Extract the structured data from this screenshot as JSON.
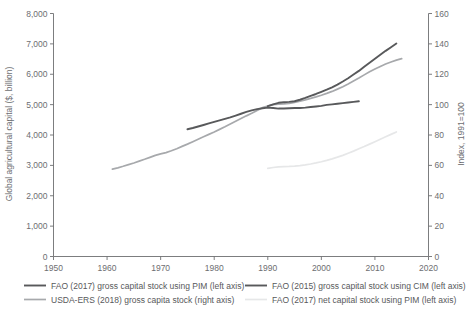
{
  "chart_data": {
    "type": "line",
    "title": "",
    "subtitle": "",
    "xlabel": "",
    "ylabel": "Global agricultural capital ($, billion)",
    "y2label": "Index, 1991=100",
    "xlim": [
      1950,
      2020
    ],
    "ylim": [
      0,
      8000
    ],
    "y2lim": [
      0,
      160
    ],
    "grid": false,
    "legend_position": "bottom",
    "x_ticks": [
      "1950",
      "1960",
      "1970",
      "1980",
      "1990",
      "2000",
      "2010",
      "2020"
    ],
    "x_tick_values": [
      1950,
      1960,
      1970,
      1980,
      1990,
      2000,
      2010,
      2020
    ],
    "y_ticks": [
      "0",
      "1,000",
      "2,000",
      "3,000",
      "4,000",
      "5,000",
      "6,000",
      "7,000",
      "8,000"
    ],
    "y_tick_values": [
      0,
      1000,
      2000,
      3000,
      4000,
      5000,
      6000,
      7000,
      8000
    ],
    "y2_ticks": [
      "0",
      "20",
      "40",
      "60",
      "80",
      "100",
      "120",
      "140",
      "160"
    ],
    "y2_tick_values": [
      0,
      20,
      40,
      60,
      80,
      100,
      120,
      140,
      160
    ],
    "series": [
      {
        "name": "FAO (2017) gross capital stock using PIM (left axis)",
        "axis": "left",
        "color": "#58595b",
        "width": 1.9,
        "x": [
          1990,
          1991,
          1992,
          1993,
          1994,
          1995,
          1996,
          1997,
          1998,
          1999,
          2000,
          2001,
          2002,
          2003,
          2004,
          2005,
          2006,
          2007,
          2008,
          2009,
          2010,
          2011,
          2012,
          2013,
          2014
        ],
        "values": [
          4950,
          5010,
          5060,
          5080,
          5090,
          5110,
          5160,
          5220,
          5290,
          5350,
          5420,
          5490,
          5570,
          5660,
          5760,
          5870,
          5990,
          6110,
          6250,
          6380,
          6510,
          6640,
          6770,
          6890,
          7010
        ]
      },
      {
        "name": "FAO (2015) gross capital stock using CIM (left axis)",
        "axis": "left",
        "color": "#58595b",
        "width": 1.9,
        "x": [
          1975,
          1976,
          1977,
          1978,
          1979,
          1980,
          1981,
          1982,
          1983,
          1984,
          1985,
          1986,
          1987,
          1988,
          1989,
          1990,
          1991,
          1992,
          1993,
          1994,
          1995,
          1996,
          1997,
          1998,
          1999,
          2000,
          2001,
          2002,
          2003,
          2004,
          2005,
          2006,
          2007
        ],
        "values": [
          4190,
          4230,
          4280,
          4330,
          4380,
          4430,
          4480,
          4530,
          4580,
          4640,
          4700,
          4760,
          4810,
          4850,
          4880,
          4900,
          4890,
          4870,
          4870,
          4880,
          4890,
          4890,
          4900,
          4920,
          4940,
          4960,
          4990,
          5010,
          5030,
          5050,
          5070,
          5090,
          5110
        ]
      },
      {
        "name": "USDA-ERS (2018) gross capita stock (right axis)",
        "axis": "right",
        "color": "#a7a9ac",
        "width": 1.7,
        "x": [
          1961,
          1962,
          1963,
          1964,
          1965,
          1966,
          1967,
          1968,
          1969,
          1970,
          1971,
          1972,
          1973,
          1974,
          1975,
          1976,
          1977,
          1978,
          1979,
          1980,
          1981,
          1982,
          1983,
          1984,
          1985,
          1986,
          1987,
          1988,
          1989,
          1990,
          1991,
          1992,
          1993,
          1994,
          1995,
          1996,
          1997,
          1998,
          1999,
          2000,
          2001,
          2002,
          2003,
          2004,
          2005,
          2006,
          2007,
          2008,
          2009,
          2010,
          2011,
          2012,
          2013,
          2014,
          2015
        ],
        "values": [
          57.5,
          58.4,
          59.4,
          60.5,
          61.6,
          62.8,
          64.0,
          65.3,
          66.6,
          67.6,
          68.4,
          69.6,
          71.0,
          72.5,
          74.0,
          75.6,
          77.2,
          78.8,
          80.4,
          82.0,
          83.7,
          85.4,
          87.2,
          89.0,
          90.8,
          92.6,
          94.3,
          96.2,
          98.0,
          99.0,
          100.0,
          100.3,
          100.5,
          100.8,
          101.4,
          102.2,
          103.1,
          104.1,
          105.1,
          106.2,
          107.4,
          108.7,
          110.2,
          111.8,
          113.6,
          115.5,
          117.5,
          119.6,
          121.6,
          123.4,
          125.1,
          126.7,
          128.1,
          129.3,
          130.3
        ]
      },
      {
        "name": "FAO (2017) net capital stock using PIM (left axis)",
        "axis": "right",
        "color": "#e6e7e8",
        "width": 1.7,
        "x": [
          1990,
          1991,
          1992,
          1993,
          1994,
          1995,
          1996,
          1997,
          1998,
          1999,
          2000,
          2001,
          2002,
          2003,
          2004,
          2005,
          2006,
          2007,
          2008,
          2009,
          2010,
          2011,
          2012,
          2013,
          2014
        ],
        "values": [
          58.0,
          58.6,
          59.0,
          59.2,
          59.3,
          59.5,
          59.8,
          60.3,
          60.9,
          61.6,
          62.4,
          63.3,
          64.3,
          65.4,
          66.6,
          68.0,
          69.4,
          70.9,
          72.4,
          74.0,
          75.6,
          77.2,
          78.8,
          80.4,
          82.0
        ]
      }
    ],
    "legend": [
      {
        "label": "FAO (2017) gross capital stock using PIM (left axis)",
        "color": "#58595b",
        "width": 1.9
      },
      {
        "label": "FAO (2015) gross capital stock using CIM (left axis)",
        "color": "#58595b",
        "width": 1.9
      },
      {
        "label": "USDA-ERS (2018) gross capita stock (right axis)",
        "color": "#a7a9ac",
        "width": 1.7
      },
      {
        "label": "FAO (2017) net capital stock using PIM (left axis)",
        "color": "#e6e7e8",
        "width": 1.7
      }
    ]
  },
  "colors": {
    "axis": "#6d6e71",
    "text": "#58595b",
    "background": "#ffffff"
  }
}
